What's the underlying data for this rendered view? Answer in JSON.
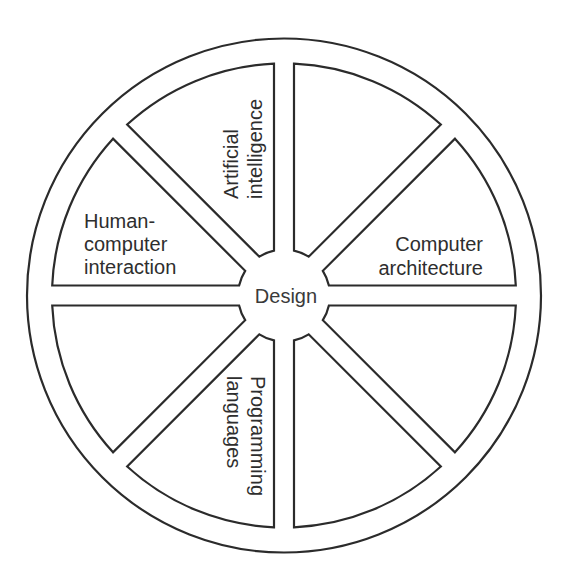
{
  "diagram": {
    "type": "wheel",
    "hub": {
      "label": "Design"
    },
    "sectors": [
      {
        "id": "top-right",
        "lines": []
      },
      {
        "id": "right-upper",
        "lines": [
          "Computer",
          "architecture"
        ]
      },
      {
        "id": "right-lower",
        "lines": []
      },
      {
        "id": "bottom-right",
        "lines": []
      },
      {
        "id": "bottom-left",
        "lines": [
          "Programming",
          "languages"
        ]
      },
      {
        "id": "left-lower",
        "lines": []
      },
      {
        "id": "left-upper",
        "lines": [
          "Human-",
          "computer",
          "interaction"
        ]
      },
      {
        "id": "top-left",
        "lines": [
          "Artificial",
          "intelligence"
        ]
      }
    ],
    "colors": {
      "stroke": "#2b2b2b",
      "text": "#2e2e2e",
      "background": "#ffffff"
    }
  }
}
